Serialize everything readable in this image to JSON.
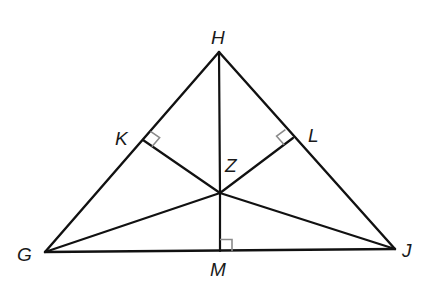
{
  "diagram": {
    "type": "triangle-incenter-construction",
    "colors": {
      "line": "#111111",
      "right_angle_mark": "#8a8a8a",
      "background": "#ffffff"
    },
    "points": {
      "H": {
        "label": "H",
        "x": 219,
        "y": 52
      },
      "G": {
        "label": "G",
        "x": 45,
        "y": 252
      },
      "J": {
        "label": "J",
        "x": 395,
        "y": 249
      },
      "K": {
        "label": "K",
        "x": 143,
        "y": 140
      },
      "L": {
        "label": "L",
        "x": 293,
        "y": 138
      },
      "M": {
        "label": "M",
        "x": 220,
        "y": 251
      },
      "Z": {
        "label": "Z",
        "x": 220,
        "y": 193
      }
    },
    "labels": {
      "H": "H",
      "G": "G",
      "J": "J",
      "K": "K",
      "L": "L",
      "M": "M",
      "Z": "Z"
    },
    "triangle_sides": [
      "HG",
      "HJ",
      "GJ"
    ],
    "interior_segments": [
      "HZ",
      "ZM",
      "ZK",
      "ZL",
      "ZG",
      "ZJ"
    ],
    "right_angles": [
      {
        "at": "K",
        "between": [
          "KH",
          "KZ"
        ]
      },
      {
        "at": "L",
        "between": [
          "LH",
          "LZ"
        ]
      },
      {
        "at": "M",
        "between": [
          "MJ",
          "MZ"
        ]
      }
    ]
  }
}
